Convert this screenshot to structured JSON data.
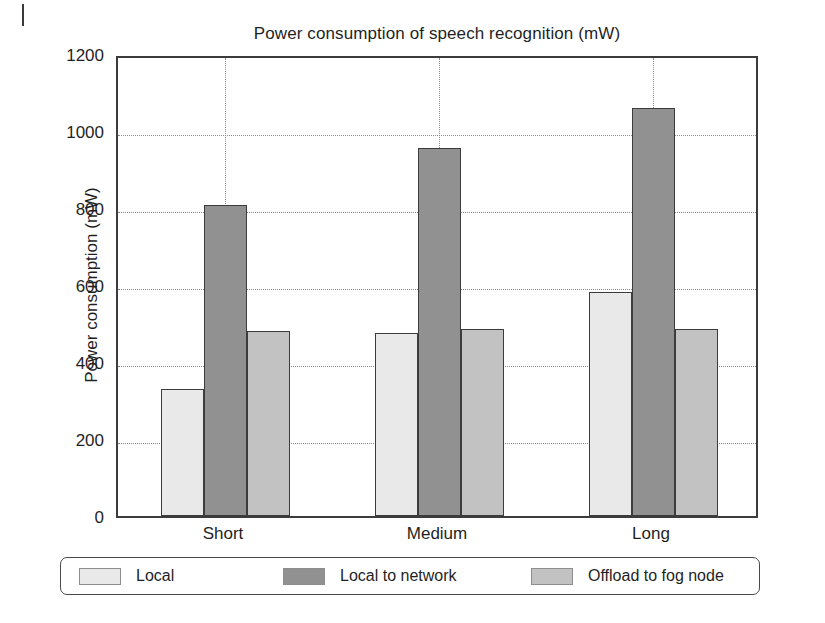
{
  "page": {
    "margin_mark": "page-edge-mark"
  },
  "chart_data": {
    "type": "bar",
    "title": "Power consumption of speech recognition (mW)",
    "xlabel": "",
    "ylabel": "Power consumption (mW)",
    "categories": [
      "Short",
      "Medium",
      "Long"
    ],
    "series": [
      {
        "name": "Local",
        "values": [
          330,
          475,
          583
        ],
        "color": "#e9e9e9"
      },
      {
        "name": "Local to network",
        "values": [
          808,
          955,
          1060
        ],
        "color": "#919191"
      },
      {
        "name": "Offload to fog node",
        "values": [
          480,
          485,
          487
        ],
        "color": "#c2c2c2"
      }
    ],
    "ylim": [
      0,
      1200
    ],
    "yticks": [
      0,
      200,
      400,
      600,
      800,
      1000,
      1200
    ],
    "ytick_labels": [
      "0",
      "200",
      "400",
      "600",
      "800",
      "1000",
      "1200"
    ],
    "grid": true,
    "grid_style": "dotted",
    "legend_position": "below",
    "axis_color": "#3c3c3c",
    "grid_color": "#8c8c8c"
  },
  "legend": {
    "items": [
      {
        "label": "Local"
      },
      {
        "label": "Local to network"
      },
      {
        "label": "Offload to fog node"
      }
    ]
  }
}
